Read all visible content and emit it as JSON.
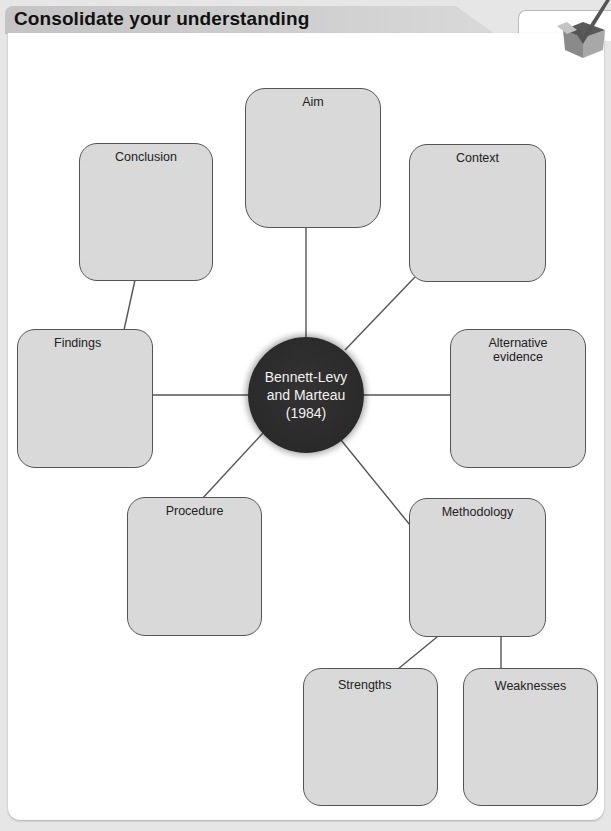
{
  "header": {
    "title": "Consolidate your understanding",
    "icon": "checkmark-box-icon"
  },
  "diagram": {
    "center": {
      "line1": "Bennett-Levy",
      "line2": "and Marteau",
      "line3": "(1984)"
    },
    "nodes": {
      "aim": "Aim",
      "conclusion": "Conclusion",
      "context": "Context",
      "findings": "Findings",
      "alternative_evidence_1": "Alternative",
      "alternative_evidence_2": "evidence",
      "procedure": "Procedure",
      "methodology": "Methodology",
      "strengths": "Strengths",
      "weaknesses": "Weaknesses"
    },
    "colors": {
      "box_fill": "#d9d9d9",
      "box_border": "#555555",
      "hub_fill": "#2a2a2a",
      "line": "#555555"
    }
  }
}
